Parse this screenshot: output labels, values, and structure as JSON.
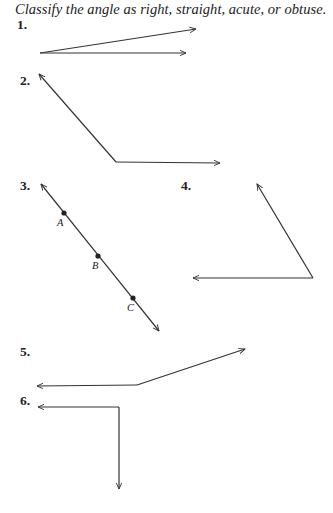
{
  "worksheet": {
    "instruction": "Classify the angle as right, straight, acute, or obtuse.",
    "problems": [
      {
        "number": "1.",
        "type_shown": "angle with two rays"
      },
      {
        "number": "2.",
        "type_shown": "angle with two rays"
      },
      {
        "number": "3.",
        "type_shown": "line with points",
        "points": [
          "A",
          "B",
          "C"
        ]
      },
      {
        "number": "4.",
        "type_shown": "angle with two rays"
      },
      {
        "number": "5.",
        "type_shown": "angle with two rays"
      },
      {
        "number": "6.",
        "type_shown": "angle with two rays"
      }
    ],
    "colors": {
      "line": "#333333",
      "text": "#222222"
    }
  }
}
